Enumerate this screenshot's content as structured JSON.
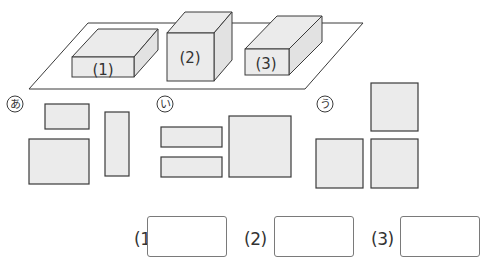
{
  "figure": {
    "colors": {
      "fill": "#ebebeb",
      "stroke": "#3a3a3a",
      "text": "#333333"
    },
    "boxes": [
      {
        "label": "(1)"
      },
      {
        "label": "(2)"
      },
      {
        "label": "(3)"
      }
    ],
    "groups": [
      {
        "label": "あ",
        "shapes": 3
      },
      {
        "label": "い",
        "shapes": 3
      },
      {
        "label": "う",
        "shapes": 3
      }
    ]
  },
  "answers": [
    {
      "label": "(1)",
      "value": ""
    },
    {
      "label": "(2)",
      "value": ""
    },
    {
      "label": "(3)",
      "value": ""
    }
  ]
}
